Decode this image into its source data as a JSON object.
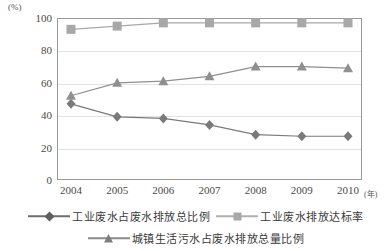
{
  "chart_data": {
    "type": "line",
    "title": "",
    "xlabel": "年",
    "ylabel": "%",
    "unit_label": "(%)",
    "x_unit_label": "(年)",
    "categories": [
      "2004",
      "2005",
      "2006",
      "2007",
      "2008",
      "2009",
      "2010"
    ],
    "ylim": [
      0,
      100
    ],
    "yticks": [
      "0",
      "20",
      "40",
      "60",
      "80",
      "100"
    ],
    "ytick_values": [
      0,
      20,
      40,
      60,
      80,
      100
    ],
    "grid": true,
    "legend_position": "bottom",
    "series": [
      {
        "name": "工业废水占废水排放总比例",
        "marker": "diamond",
        "color": "#7a7a7a",
        "values": [
          47,
          39,
          38,
          34,
          28,
          27,
          27
        ]
      },
      {
        "name": "工业废水排放达标率",
        "marker": "square",
        "color": "#a8a8a8",
        "values": [
          93,
          95,
          97,
          97,
          97,
          97,
          97
        ]
      },
      {
        "name": "城镇生活污水占废水排放总量比例",
        "marker": "triangle",
        "color": "#8f8f8f",
        "values": [
          52,
          60,
          61,
          64,
          70,
          70,
          69
        ]
      }
    ]
  },
  "colors": {
    "axis": "#9a9a9a",
    "grid": "#e2e2e2",
    "text": "#3a3a3a",
    "series_diamond": "#6f6f6f",
    "series_square": "#b0b0b0",
    "series_triangle": "#8a8a8a"
  }
}
